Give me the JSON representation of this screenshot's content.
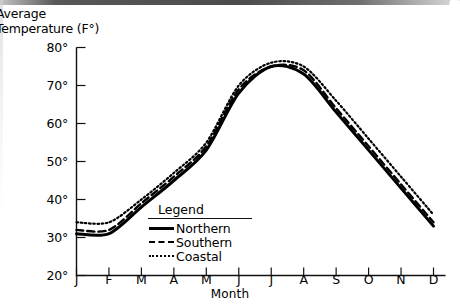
{
  "chart_data": {
    "type": "line",
    "title": "Average\nTemperature (F°)",
    "xlabel": "Month",
    "ylabel": "Average Temperature (F°)",
    "categories": [
      "J",
      "F",
      "M",
      "A",
      "M",
      "J",
      "J",
      "A",
      "S",
      "O",
      "N",
      "D"
    ],
    "category_names": [
      "January",
      "February",
      "March",
      "April",
      "May",
      "June",
      "July",
      "August",
      "September",
      "October",
      "November",
      "December"
    ],
    "ylim": [
      20,
      80
    ],
    "ytick_values": [
      80,
      70,
      60,
      50,
      40,
      30,
      20
    ],
    "ytick_labels": [
      "80°",
      "70°",
      "60°",
      "50°",
      "40°",
      "30°",
      "20°"
    ],
    "grid": false,
    "legend_position": "inside-bottom-left",
    "legend_title": "Legend",
    "series": [
      {
        "name": "Northern",
        "style": "solid",
        "color": "#000000",
        "values": [
          31,
          31,
          38,
          45,
          53,
          68,
          75,
          73,
          63,
          53,
          43,
          33
        ]
      },
      {
        "name": "Southern",
        "style": "dashed",
        "color": "#000000",
        "values": [
          32,
          32,
          39,
          46,
          54,
          69,
          75,
          74,
          64,
          54,
          44,
          34
        ]
      },
      {
        "name": "Coastal",
        "style": "dotted",
        "color": "#000000",
        "values": [
          34,
          34,
          40,
          47,
          55,
          70,
          76,
          75,
          66,
          56,
          46,
          36
        ]
      }
    ]
  }
}
